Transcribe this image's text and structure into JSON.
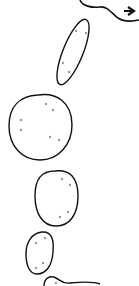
{
  "diagram": {
    "background": "#ffffff",
    "stroke_color": "#111111",
    "dot_color": "#9a9a9a",
    "shapes": [
      {
        "name": "top-path-with-arrow",
        "type": "curve-arrow"
      },
      {
        "name": "ellipse-1",
        "dots": 4
      },
      {
        "name": "circle-2",
        "dots": 6
      },
      {
        "name": "oval-3",
        "dots": 4
      },
      {
        "name": "oval-4",
        "dots": 4
      },
      {
        "name": "bottom-blob",
        "dots": 1
      }
    ]
  }
}
